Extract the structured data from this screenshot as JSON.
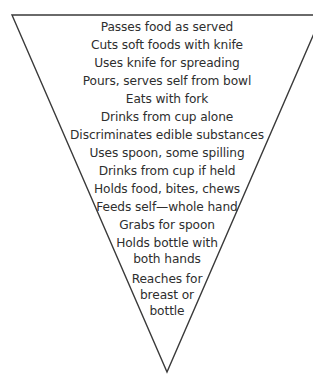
{
  "diagram": {
    "shape": "inverted-triangle",
    "stroke_color": "#3a3a3a",
    "text_color": "#2e2e2e",
    "stages": [
      {
        "lines": [
          "Passes food as served"
        ]
      },
      {
        "lines": [
          "Cuts soft foods with knife"
        ]
      },
      {
        "lines": [
          "Uses knife for spreading"
        ]
      },
      {
        "lines": [
          "Pours, serves self from bowl"
        ]
      },
      {
        "lines": [
          "Eats with fork"
        ]
      },
      {
        "lines": [
          "Drinks from cup alone"
        ]
      },
      {
        "lines": [
          "Discriminates edible substances"
        ]
      },
      {
        "lines": [
          "Uses spoon, some spilling"
        ]
      },
      {
        "lines": [
          "Drinks from cup if held"
        ]
      },
      {
        "lines": [
          "Holds food, bites, chews"
        ]
      },
      {
        "lines": [
          "Feeds self—whole hand"
        ]
      },
      {
        "lines": [
          "Grabs for spoon"
        ]
      },
      {
        "lines": [
          "Holds bottle with",
          "both hands"
        ]
      },
      {
        "lines": [
          "Reaches for",
          "breast or",
          "bottle"
        ]
      }
    ]
  }
}
